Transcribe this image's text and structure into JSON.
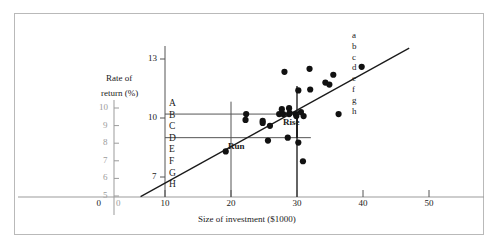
{
  "figure": {
    "title": "",
    "axis_label_x": "Size of investment ($1000)",
    "axis_label_y_line1": "Rate of",
    "axis_label_y_line2": "return (%)",
    "annotation_rise": "Rise",
    "annotation_run": "Run",
    "marker_color": "#111111",
    "line_color": "#1a1a1a",
    "guide_color": "#555555",
    "ghost_color": "#9b9b9b",
    "frame_color": "#b9b9b9"
  },
  "ghost_axis": {
    "y_ticks": [
      "10",
      "9",
      "8",
      "7",
      "6",
      "5"
    ],
    "origin_label": "0"
  },
  "left_letters": [
    "A",
    "B",
    "C",
    "D",
    "E",
    "F",
    "G",
    "H"
  ],
  "right_letters": [
    "a",
    "b",
    "c",
    "d",
    "e",
    "f",
    "g",
    "h"
  ],
  "chart_data": {
    "type": "scatter",
    "title": "",
    "xlabel": "Size of investment ($1000)",
    "ylabel": "Rate of return (%)",
    "xlim": [
      0,
      53
    ],
    "ylim": [
      5,
      13.8
    ],
    "xticks": [
      0,
      10,
      20,
      30,
      40,
      50
    ],
    "xticklabels": [
      "0",
      "10",
      "20",
      "30",
      "40",
      "50"
    ],
    "yticks": [
      7,
      10,
      13
    ],
    "yticklabels": [
      "7",
      "10",
      "13"
    ],
    "grid": false,
    "legend": null,
    "points": [
      {
        "x": 19.2,
        "y": 8.3
      },
      {
        "x": 22.3,
        "y": 10.2
      },
      {
        "x": 22.2,
        "y": 9.9
      },
      {
        "x": 24.8,
        "y": 9.85
      },
      {
        "x": 24.8,
        "y": 9.75
      },
      {
        "x": 25.6,
        "y": 8.85
      },
      {
        "x": 25.9,
        "y": 9.6
      },
      {
        "x": 27.3,
        "y": 10.2
      },
      {
        "x": 27.9,
        "y": 10.2
      },
      {
        "x": 27.7,
        "y": 10.45
      },
      {
        "x": 28.1,
        "y": 12.35
      },
      {
        "x": 28.8,
        "y": 10.5
      },
      {
        "x": 28.8,
        "y": 10.2
      },
      {
        "x": 28.9,
        "y": 10.25
      },
      {
        "x": 28.6,
        "y": 9.0
      },
      {
        "x": 29.8,
        "y": 10.2
      },
      {
        "x": 29.9,
        "y": 10.1
      },
      {
        "x": 30.2,
        "y": 11.4
      },
      {
        "x": 30.2,
        "y": 8.75
      },
      {
        "x": 30.6,
        "y": 10.3
      },
      {
        "x": 31.0,
        "y": 10.1
      },
      {
        "x": 30.9,
        "y": 7.8
      },
      {
        "x": 31.9,
        "y": 12.5
      },
      {
        "x": 32.0,
        "y": 11.45
      },
      {
        "x": 34.3,
        "y": 11.8
      },
      {
        "x": 34.9,
        "y": 11.7
      },
      {
        "x": 35.5,
        "y": 12.2
      },
      {
        "x": 36.3,
        "y": 10.2
      },
      {
        "x": 39.8,
        "y": 12.6
      }
    ],
    "fit_line": {
      "x0": 6.3,
      "y0": 6.0,
      "x1": 47.0,
      "y1": 13.55
    },
    "guides": {
      "h_upper_y": 10.2,
      "h_upper_x_end": 30.0,
      "h_lower_y": 9.0,
      "h_lower_x_end": 32.1,
      "v_run_x": 20.0,
      "v_rise_x": 30.0
    }
  }
}
